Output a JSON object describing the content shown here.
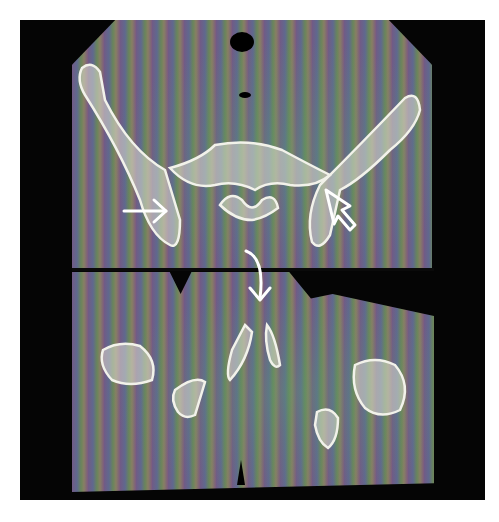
{
  "figure": {
    "type": "axial CT images of pelvis (two slices, stacked)",
    "panels": [
      {
        "id": "top",
        "content": "pelvis at level of acetabula / sacrum"
      },
      {
        "id": "bottom",
        "content": "level of femoral heads / pubic symphysis"
      }
    ],
    "annotations": [
      {
        "name": "straight-arrow",
        "panel": "top",
        "direction": "right",
        "points_to": "right acetabulum"
      },
      {
        "name": "open-arrowhead",
        "panel": "top",
        "direction": "up-left",
        "points_to": "left acetabulum"
      },
      {
        "name": "curved-arrow",
        "panel": "bottom",
        "direction": "down",
        "points_to": "pubic symphysis"
      }
    ],
    "colors": {
      "background": "#ffffff",
      "frame": "#050505",
      "bone": "#f2f2ea",
      "arrow": "#ffffff"
    }
  }
}
